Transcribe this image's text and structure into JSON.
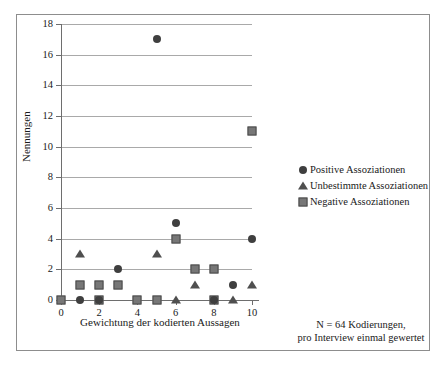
{
  "chart_data": {
    "type": "scatter",
    "title": "",
    "xlabel": "Gewichtung der kodierten Aussagen",
    "ylabel": "Nennungen",
    "xlim": [
      0,
      10
    ],
    "ylim": [
      0,
      18
    ],
    "xticks": [
      0,
      2,
      4,
      6,
      8,
      10
    ],
    "yticks": [
      0,
      2,
      4,
      6,
      8,
      10,
      12,
      14,
      16,
      18
    ],
    "grid": "horizontal",
    "legend_position": "right",
    "series": [
      {
        "name": "Positive Assoziationen",
        "marker": "circle",
        "color": "#3f3f3f",
        "points": [
          {
            "x": 1,
            "y": 0
          },
          {
            "x": 2,
            "y": 0
          },
          {
            "x": 8,
            "y": 0
          },
          {
            "x": 9,
            "y": 1
          },
          {
            "x": 3,
            "y": 2
          },
          {
            "x": 10,
            "y": 4
          },
          {
            "x": 6,
            "y": 5
          },
          {
            "x": 5,
            "y": 17
          }
        ]
      },
      {
        "name": "Unbestimmte Assoziationen",
        "marker": "triangle",
        "color": "#4f4f4f",
        "points": [
          {
            "x": 6,
            "y": 0
          },
          {
            "x": 9,
            "y": 0
          },
          {
            "x": 7,
            "y": 1
          },
          {
            "x": 10,
            "y": 1
          },
          {
            "x": 1,
            "y": 3
          },
          {
            "x": 5,
            "y": 3
          }
        ]
      },
      {
        "name": "Negative Assoziationen",
        "marker": "square",
        "color": "#777777",
        "points": [
          {
            "x": 0,
            "y": 0
          },
          {
            "x": 2,
            "y": 0
          },
          {
            "x": 4,
            "y": 0
          },
          {
            "x": 5,
            "y": 0
          },
          {
            "x": 8,
            "y": 0
          },
          {
            "x": 1,
            "y": 1
          },
          {
            "x": 2,
            "y": 1
          },
          {
            "x": 3,
            "y": 1
          },
          {
            "x": 7,
            "y": 2
          },
          {
            "x": 8,
            "y": 2
          },
          {
            "x": 6,
            "y": 4
          },
          {
            "x": 10,
            "y": 11
          }
        ]
      }
    ],
    "annotations": [
      "N = 64 Kodierungen,",
      "pro Interview einmal gewertet"
    ]
  },
  "legend": {
    "items": [
      {
        "label": "Positive Assoziationen",
        "marker": "circle"
      },
      {
        "label": "Unbestimmte Assoziationen",
        "marker": "triangle"
      },
      {
        "label": "Negative Assoziationen",
        "marker": "square"
      }
    ]
  },
  "note": {
    "line1": "N = 64 Kodierungen,",
    "line2": "pro Interview einmal gewertet"
  },
  "colors": {
    "grid": "#a9a9a9",
    "axis": "#6e6e6e",
    "frame": "#8d8d8d",
    "circle": "#3f3f3f",
    "triangle": "#4f4f4f",
    "square_fill": "#777777",
    "square_edge": "#4a4a4a",
    "text": "#1a1a1a"
  }
}
